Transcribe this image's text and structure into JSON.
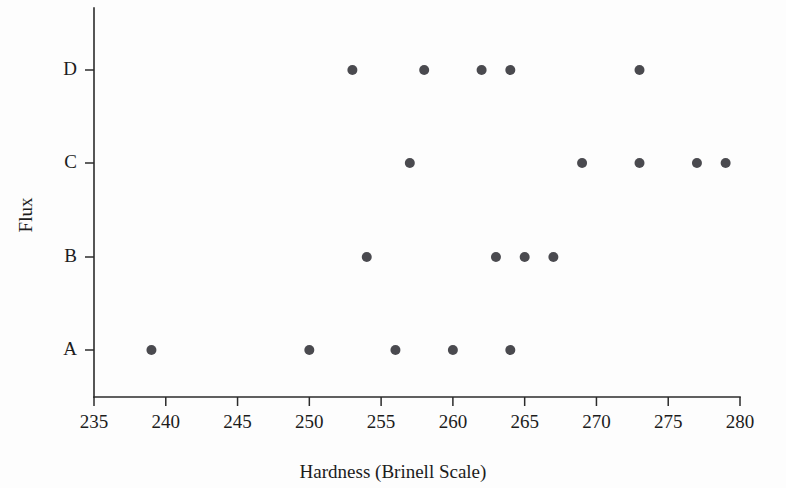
{
  "chart_data": {
    "type": "scatter",
    "title": "",
    "subtitle": "",
    "xlabel": "Hardness (Brinell Scale)",
    "ylabel": "Flux",
    "xlim": [
      235,
      280
    ],
    "ylim_categories": [
      "A",
      "B",
      "C",
      "D"
    ],
    "x_ticks": [
      235,
      240,
      245,
      250,
      255,
      260,
      265,
      270,
      275,
      280
    ],
    "x_tick_labels": [
      "235",
      "240",
      "245",
      "250",
      "255",
      "260",
      "265",
      "270",
      "275",
      "280"
    ],
    "y_ticks": [
      "A",
      "B",
      "C",
      "D"
    ],
    "y_tick_labels": [
      "A",
      "B",
      "C",
      "D"
    ],
    "grid": false,
    "legend": false,
    "legend_position": "none",
    "marker": "filled-circle",
    "marker_color": "#4a4a4f",
    "marker_size": 5,
    "series": [
      {
        "name": "A",
        "category": "A",
        "values": [
          239,
          250,
          256,
          260,
          264
        ]
      },
      {
        "name": "B",
        "category": "B",
        "values": [
          254,
          263,
          265,
          267
        ]
      },
      {
        "name": "C",
        "category": "C",
        "values": [
          257,
          269,
          273,
          277,
          279
        ]
      },
      {
        "name": "D",
        "category": "D",
        "values": [
          253,
          258,
          262,
          264,
          273
        ]
      }
    ],
    "points": [
      {
        "flux": "A",
        "hardness": 239
      },
      {
        "flux": "A",
        "hardness": 250
      },
      {
        "flux": "A",
        "hardness": 256
      },
      {
        "flux": "A",
        "hardness": 260
      },
      {
        "flux": "A",
        "hardness": 264
      },
      {
        "flux": "B",
        "hardness": 254
      },
      {
        "flux": "B",
        "hardness": 263
      },
      {
        "flux": "B",
        "hardness": 265
      },
      {
        "flux": "B",
        "hardness": 267
      },
      {
        "flux": "C",
        "hardness": 257
      },
      {
        "flux": "C",
        "hardness": 269
      },
      {
        "flux": "C",
        "hardness": 273
      },
      {
        "flux": "C",
        "hardness": 277
      },
      {
        "flux": "C",
        "hardness": 279
      },
      {
        "flux": "D",
        "hardness": 253
      },
      {
        "flux": "D",
        "hardness": 258
      },
      {
        "flux": "D",
        "hardness": 262
      },
      {
        "flux": "D",
        "hardness": 264
      },
      {
        "flux": "D",
        "hardness": 273
      }
    ],
    "colors": {
      "axis": "#2b2b2b",
      "marker": "#4a4a4f",
      "text": "#1c1c1c",
      "background": "#fdfdfd"
    }
  }
}
